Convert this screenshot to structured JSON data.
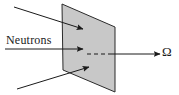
{
  "figure": {
    "background_color": "#ffffff",
    "stroke_color": "#1a1a1a",
    "labels": {
      "incident_beam": "Neutrons",
      "solid_angle": "Ω"
    },
    "target_plane": {
      "name": "target-plane",
      "shape": "parallelogram",
      "fill_color": "#c8c8c8",
      "stroke_color": "#2b2b2b",
      "stroke_width": 1,
      "points": "62,4 115,27 115,92 63,70"
    },
    "incident_arrows": [
      {
        "name": "incident-arrow-top",
        "x1": 14,
        "y1": 7,
        "x2": 83,
        "y2": 29
      },
      {
        "name": "incident-arrow-middle",
        "x1": 5,
        "y1": 49,
        "x2": 83,
        "y2": 49
      },
      {
        "name": "incident-arrow-bottom",
        "x1": 17,
        "y1": 89,
        "x2": 89,
        "y2": 67
      }
    ],
    "dashed_segment": {
      "name": "scattering-axis-dashed",
      "x1": 87,
      "y1": 54,
      "x2": 112,
      "y2": 54,
      "dash_pattern": "4,3"
    },
    "exit_arrow": {
      "name": "scattered-beam-arrow",
      "x1": 112,
      "y1": 54,
      "x2": 160,
      "y2": 54
    },
    "arrowhead": {
      "name": "arrowhead-marker",
      "color": "#1a1a1a"
    }
  }
}
